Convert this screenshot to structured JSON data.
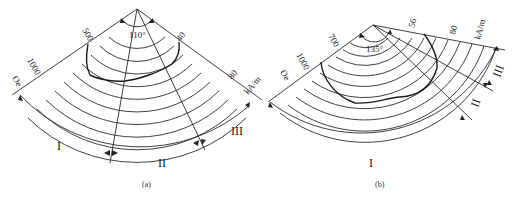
{
  "figure": {
    "panels": [
      {
        "id": "a",
        "caption": "(a)",
        "angle_label": "110°",
        "radial_labels": [
          "500",
          "1000",
          "Oe"
        ],
        "right_labels": [
          "40",
          "80",
          "kA/m"
        ],
        "regions": [
          "I",
          "II",
          "III"
        ]
      },
      {
        "id": "b",
        "caption": "(b)",
        "angle_label": "135°",
        "radial_labels": [
          "700",
          "1000",
          "Oe"
        ],
        "right_labels": [
          "56",
          "80",
          "kA/m"
        ],
        "regions": [
          "I",
          "II",
          "III"
        ]
      }
    ]
  }
}
